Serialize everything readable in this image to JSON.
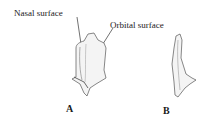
{
  "figure": {
    "labels": {
      "nasal_surface": "Nasal surface",
      "orbital_surface": "Orbital surface"
    },
    "panels": [
      {
        "id": "A",
        "label": "A"
      },
      {
        "id": "B",
        "label": "B"
      }
    ]
  }
}
